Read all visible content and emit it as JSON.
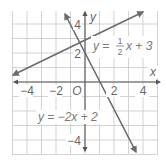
{
  "chart_data": {
    "type": "line",
    "title": "",
    "xlabel": "x",
    "ylabel": "y",
    "xlim": [
      -5,
      5
    ],
    "ylim": [
      -5,
      5
    ],
    "grid": true,
    "origin_label": "O",
    "x_ticks": [
      {
        "value": -4,
        "label": "−4"
      },
      {
        "value": -2,
        "label": "−2"
      },
      {
        "value": 2,
        "label": "2"
      },
      {
        "value": 4,
        "label": "4"
      }
    ],
    "y_ticks": [
      {
        "value": 4,
        "label": "4"
      },
      {
        "value": 2,
        "label": "2"
      },
      {
        "value": -4,
        "label": "−4"
      }
    ],
    "series": [
      {
        "name": "y = 1/2 x + 3",
        "equation": {
          "lhs": "y =",
          "num": "1",
          "den": "2",
          "rhs": "x + 3"
        },
        "slope": 0.5,
        "intercept": 3,
        "x": [
          -5,
          4
        ],
        "values": [
          0.5,
          5
        ],
        "color": "#6b6b6b"
      },
      {
        "name": "y = −2x + 2",
        "equation": {
          "text": "y = −2x + 2"
        },
        "slope": -2,
        "intercept": 2,
        "x": [
          -1.5,
          3.5
        ],
        "values": [
          5,
          -5
        ],
        "color": "#6b6b6b"
      }
    ],
    "intersection": {
      "x": -0.4,
      "y": 2.8
    }
  }
}
